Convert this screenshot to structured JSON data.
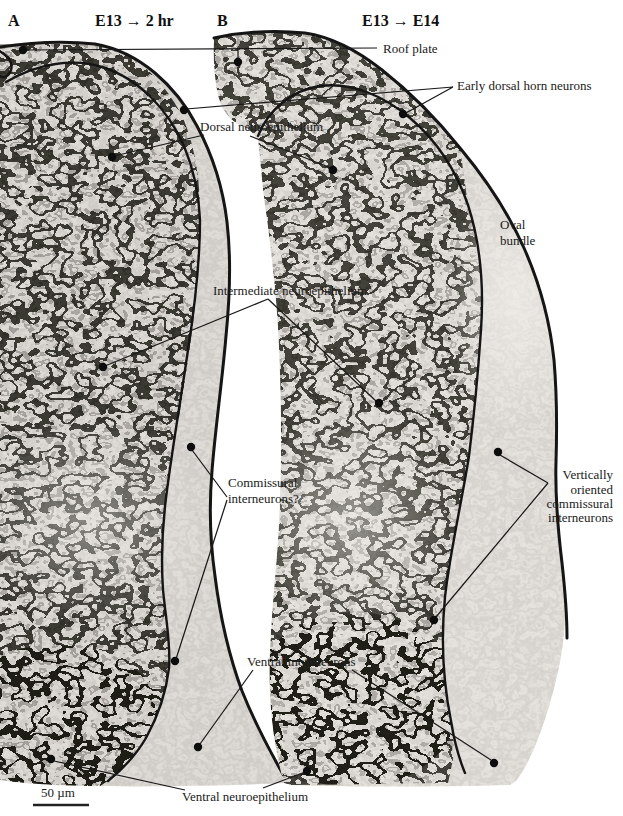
{
  "panels": {
    "a": {
      "label": "A",
      "condition": "E13 → 2 hr"
    },
    "b": {
      "label": "B",
      "condition": "E13 → E14"
    }
  },
  "annotations": {
    "roof_plate": "Roof plate",
    "early_dorsal_horn_neurons": "Early dorsal horn neurons",
    "dorsal_neuroepithelium": "Dorsal neuroepithelium",
    "oval_bundle": [
      "Oval",
      "bundle"
    ],
    "intermediate_neuroepithelium": "Intermediate neuroepithelium",
    "commissural_interneurons": [
      "Commissural",
      "interneurons?"
    ],
    "vertically_oriented": [
      "Vertically",
      "oriented",
      "commissural",
      "interneurons"
    ],
    "ventral_motoneurons": "Ventral motoneurons",
    "ventral_neuroepithelium": "Ventral neuroepithelium"
  },
  "scale_bar": {
    "label": "50 µm"
  },
  "palette": {
    "ink": "#1a1a1a",
    "contour": "#151515",
    "background": "#ffffff"
  }
}
